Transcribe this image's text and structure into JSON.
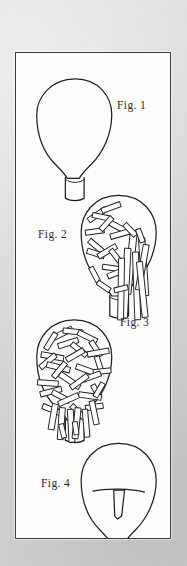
{
  "plate": {
    "background_color": "#d9d9d7",
    "panel_background_color": "#fdfdfc",
    "panel_border_color": "#3a3a38",
    "ink_color": "#1f1f1f",
    "figure_count": 4
  },
  "figures": [
    {
      "id": "fig-1",
      "label": "Fig. 1",
      "subject": "balloon-empty",
      "description": "Empty balloon envelope outline with rectangular neck collar",
      "fill_state": "empty",
      "stick_count": 0
    },
    {
      "id": "fig-2",
      "label": "Fig. 2",
      "subject": "balloon-partially-filled",
      "description": "Balloon envelope partially packed with elongated rod elements, a bundle protruding through the neck",
      "fill_state": "partial",
      "stick_count": 26
    },
    {
      "id": "fig-3",
      "label": "Fig. 3",
      "subject": "balloon-fully-filled",
      "description": "Balloon envelope densely packed throughout with interwoven rod elements extending into the neck",
      "fill_state": "full",
      "stick_count": 58
    },
    {
      "id": "fig-4",
      "label": "Fig. 4",
      "subject": "balloon-with-insert",
      "description": "Balloon envelope with a horizontal member and a central tapered wedge insert",
      "fill_state": "insert",
      "stick_count": 0
    }
  ]
}
